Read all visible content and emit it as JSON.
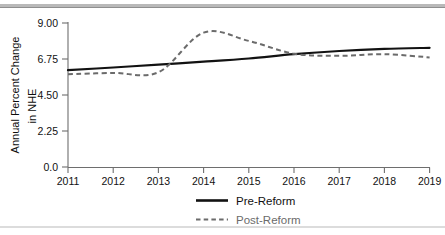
{
  "chart_data": {
    "type": "line",
    "title": "",
    "xlabel": "",
    "ylabel": "Annual Percent Change in NHE",
    "ylabel_line1": "Annual Percent Change",
    "ylabel_line2": "in NHE",
    "x": [
      2011,
      2012,
      2013,
      2014,
      2015,
      2016,
      2017,
      2018,
      2019
    ],
    "categories": [
      "2011",
      "2012",
      "2013",
      "2014",
      "2015",
      "2016",
      "2017",
      "2018",
      "2019"
    ],
    "xtick_labels": [
      "2011",
      "2012",
      "2013",
      "2014",
      "2015",
      "2016",
      "2017",
      "2018",
      "2019"
    ],
    "ytick_labels": [
      "9.00",
      "6.75",
      "4.50",
      "2.25",
      "0.0"
    ],
    "ytick_values": [
      9.0,
      6.75,
      4.5,
      2.25,
      0.0
    ],
    "ylim": [
      0.0,
      9.0
    ],
    "xlim": [
      2011,
      2019
    ],
    "grid": false,
    "legend_position": "bottom-center",
    "series": [
      {
        "name": "Pre-Reform",
        "style": "solid",
        "color": "#121212",
        "values": [
          6.05,
          6.22,
          6.4,
          6.58,
          6.78,
          7.05,
          7.25,
          7.38,
          7.45
        ]
      },
      {
        "name": "Post-Reform",
        "style": "dashed",
        "color": "#6b6b6b",
        "values": [
          5.8,
          5.88,
          5.92,
          8.4,
          7.88,
          7.08,
          6.95,
          7.05,
          6.85
        ]
      }
    ]
  },
  "legend": {
    "items": [
      {
        "label": "Pre-Reform",
        "style": "solid",
        "color": "#121212"
      },
      {
        "label": "Post-Reform",
        "style": "dashed",
        "color": "#6b6b6b"
      }
    ]
  },
  "colors": {
    "pre_reform": "#121212",
    "post_reform": "#6b6b6b",
    "axis": "#6e6e6e",
    "text": "#111111",
    "rule": "#b9b9b9"
  }
}
